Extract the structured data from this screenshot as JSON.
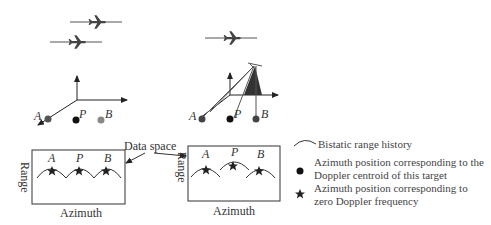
{
  "diagram": {
    "left_scene": {
      "points": [
        {
          "label": "A",
          "color": "#555555"
        },
        {
          "label": "P",
          "color": "#111111"
        },
        {
          "label": "B",
          "color": "#888888"
        }
      ]
    },
    "right_scene": {
      "points": [
        {
          "label": "A",
          "color": "#444444"
        },
        {
          "label": "P",
          "color": "#111111"
        },
        {
          "label": "B",
          "color": "#444444"
        }
      ]
    },
    "data_space_label": "Data space",
    "left_panel": {
      "x_axis": "Azimuth",
      "y_axis": "Range",
      "targets": [
        "A",
        "P",
        "B"
      ]
    },
    "right_panel": {
      "x_axis": "Azimuth",
      "y_axis": "Range",
      "targets": [
        "A",
        "P",
        "B"
      ]
    },
    "legend": [
      {
        "icon": "arc-icon",
        "text": "Bistatic range history"
      },
      {
        "icon": "dot-icon",
        "line1": "Azimuth position corresponding to the",
        "line2": "Doppler centroid of this target"
      },
      {
        "icon": "star-icon",
        "line1": "Azimuth position corresponding to",
        "line2": "zero Doppler frequency"
      }
    ]
  }
}
